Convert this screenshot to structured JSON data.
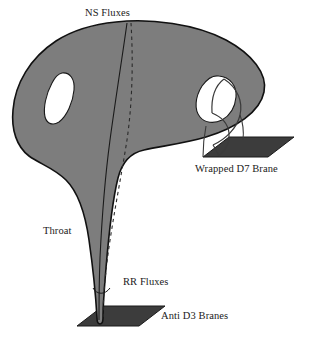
{
  "figure": {
    "kind": "physics-diagram",
    "background_color": "#ffffff",
    "body_fill_color": "#7d7d7d",
    "body_stroke_color": "#111111",
    "hole_fill_color": "#ffffff",
    "brane_fill_color": "#3c3c3c",
    "brane_stroke_color": "#1a1a1a",
    "dashed_line_color": "#2b2b2b",
    "text_color": "#1a1a1a"
  },
  "labels": {
    "ns_fluxes": "NS Fluxes",
    "wrapped_d7_brane": "Wrapped D7 Brane",
    "throat": "Throat",
    "rr_fluxes": "RR Fluxes",
    "anti_d3_branes": "Anti D3 Branes"
  },
  "elements": {
    "bulk_label": "compact-bulk-body",
    "left_hole_label": "left-white-hole",
    "right_hole_label": "right-white-hole",
    "throat_label": "warped-throat",
    "tip_label": "throat-tip",
    "d7_tube_label": "d7-wrapping-tube",
    "d7_plane_label": "d7-brane-plane",
    "d3_plane_label": "anti-d3-brane-plane",
    "solid_meridian_label": "solid-meridian-curve",
    "dashed_meridian_label": "dashed-meridian-curve"
  }
}
